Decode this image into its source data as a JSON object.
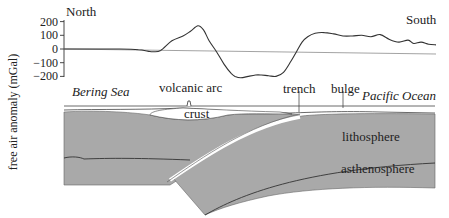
{
  "chart_data": {
    "type": "line",
    "title": "",
    "ylabel": "free air anomaly (mGal)",
    "xlabel": "",
    "ylim": [
      -200,
      200
    ],
    "yticks": [
      200,
      100,
      0,
      -100,
      -200
    ],
    "ytick_labels": [
      "200",
      "100",
      "0",
      "−100",
      "−200"
    ],
    "grid": false,
    "legend": "none",
    "annotations": {
      "left": "North",
      "right": "South"
    },
    "series": [
      {
        "name": "free air anomaly",
        "x": [
          0,
          10,
          20,
          30,
          40,
          45,
          48,
          52,
          58,
          64,
          68,
          72,
          75,
          78,
          82,
          86,
          90,
          92,
          95,
          99,
          103,
          106,
          110,
          114,
          118,
          122,
          125,
          128,
          131,
          135,
          140,
          145,
          150,
          155,
          160,
          165,
          170,
          175,
          180,
          185,
          188,
          192,
          196,
          200
        ],
        "values": [
          0,
          0,
          0,
          0,
          -5,
          -15,
          -20,
          -10,
          60,
          95,
          130,
          170,
          140,
          60,
          -20,
          -110,
          -180,
          -200,
          -210,
          -200,
          -190,
          -190,
          -195,
          -200,
          -170,
          -90,
          -20,
          50,
          90,
          115,
          120,
          110,
          95,
          95,
          100,
          90,
          105,
          70,
          50,
          65,
          40,
          50,
          35,
          30
        ]
      }
    ]
  },
  "section": {
    "labels": {
      "bering_sea": "Bering Sea",
      "volcanic_arc": "volcanic arc",
      "crust": "crust",
      "trench": "trench",
      "bulge": "bulge",
      "pacific_ocean": "Pacific Ocean",
      "lithosphere": "lithosphere",
      "asthenosphere": "asthenosphere"
    },
    "colors": {
      "lithosphere": "#a9a9a9",
      "crust": "#ffffff",
      "ocean": "#ffffff",
      "line": "#333333"
    }
  }
}
